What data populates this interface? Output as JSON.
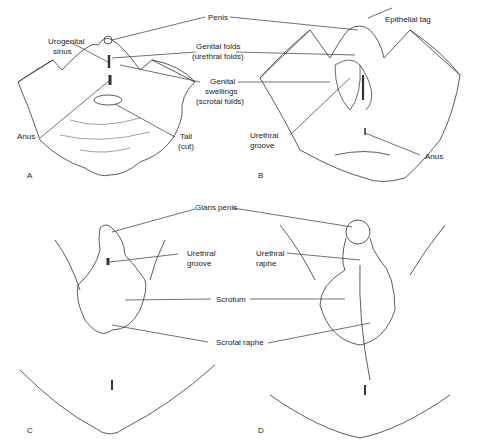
{
  "figure": {
    "panels": [
      {
        "id": "A",
        "letter": "A"
      },
      {
        "id": "B",
        "letter": "B"
      },
      {
        "id": "C",
        "letter": "C"
      },
      {
        "id": "D",
        "letter": "D"
      }
    ],
    "labels": {
      "penis": "Penis",
      "urogenital_sinus_1": "Urogenital",
      "urogenital_sinus_2": "sinus",
      "genital_folds_1": "Genital folds",
      "genital_folds_2": "(urethral folds)",
      "genital_swellings_1": "Genital",
      "genital_swellings_2": "swellings",
      "genital_swellings_3": "(scrotal folds)",
      "anus_a": "Anus",
      "tail_1": "Tail",
      "tail_2": "(cut)",
      "epithelial_tag": "Epithelial tag",
      "urethral_groove_b_1": "Urethral",
      "urethral_groove_b_2": "groove",
      "anus_b": "Anus",
      "glans_penis": "Glans penis",
      "urethral_groove_c_1": "Urethral",
      "urethral_groove_c_2": "groove",
      "urethral_raphe_1": "Urethral",
      "urethral_raphe_2": "raphe",
      "scrotum": "Scrotum",
      "scrotal_raphe": "Scrotal raphe"
    }
  }
}
